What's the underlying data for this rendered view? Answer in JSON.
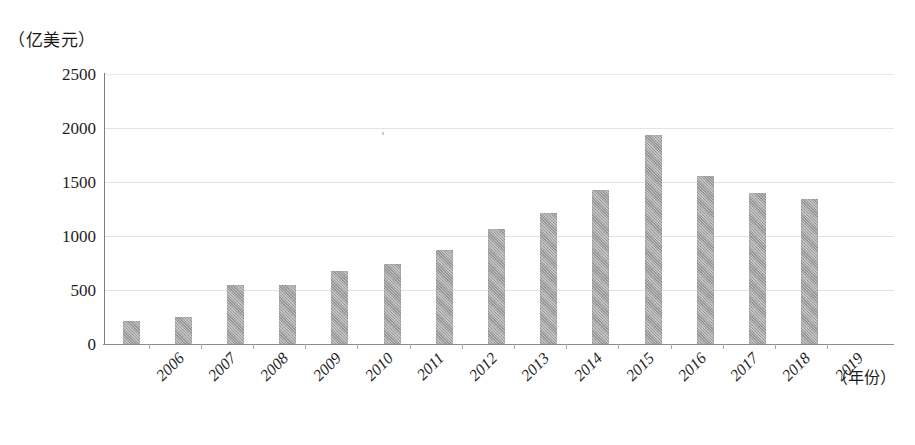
{
  "chart_data": {
    "type": "bar",
    "title": "",
    "subtitle": "",
    "xlabel": "（年份）",
    "ylabel": "（亿美元）",
    "categories": [
      "2006",
      "2007",
      "2008",
      "2009",
      "2010",
      "2011",
      "2012",
      "2013",
      "2014",
      "2015",
      "2016",
      "2017",
      "2018",
      "2019"
    ],
    "values": [
      210,
      250,
      550,
      550,
      680,
      740,
      870,
      1065,
      1210,
      1430,
      1935,
      1560,
      1400,
      1340
    ],
    "series": [
      {
        "name": "",
        "values": [
          210,
          250,
          550,
          550,
          680,
          740,
          870,
          1065,
          1210,
          1430,
          1935,
          1560,
          1400,
          1340
        ]
      }
    ],
    "ylim": [
      0,
      2500
    ],
    "yticks": [
      0,
      500,
      1000,
      1500,
      2000,
      2500
    ],
    "ytick_labels": [
      "0",
      "500",
      "1000",
      "1500",
      "2000",
      "2500"
    ],
    "grid": true,
    "grid_axis": "y",
    "legend": false,
    "legend_position": "none",
    "bar_color": "#9d9d9d",
    "grid_color": "#e3e3e6",
    "axis_color": "#7d7d80",
    "xtick_rotation": -45
  },
  "axes": {
    "y_unit_label": "（亿美元）",
    "x_unit_label": "（年份）"
  }
}
